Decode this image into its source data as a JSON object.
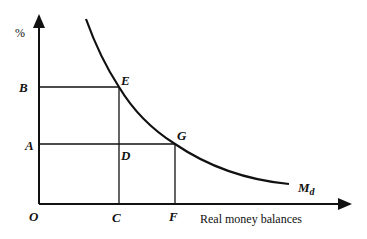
{
  "diagram": {
    "y_axis_label": "%",
    "x_axis_label": "Real money balances",
    "origin_label": "O",
    "curve_label": "M",
    "curve_label_sub": "d",
    "points": {
      "B": "B",
      "A": "A",
      "C": "C",
      "F": "F",
      "E": "E",
      "G": "G",
      "D": "D"
    },
    "colors": {
      "line": "#111111",
      "background": "#ffffff"
    }
  }
}
